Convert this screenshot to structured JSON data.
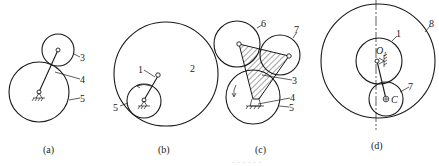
{
  "figure": {
    "panels": [
      {
        "id": "a",
        "caption": "(a)",
        "labels": {
          "l3": "3",
          "l4": "4",
          "l5": "5"
        }
      },
      {
        "id": "b",
        "caption": "(b)",
        "labels": {
          "l1": "1",
          "l2": "2",
          "l5": "5"
        }
      },
      {
        "id": "c",
        "caption": "(c)",
        "labels": {
          "l6": "6",
          "l7": "7",
          "l3": "3",
          "l4": "4",
          "l5": "5"
        }
      },
      {
        "id": "d",
        "caption": "(d)",
        "labels": {
          "l8": "8",
          "l1": "1",
          "O1": "O",
          "O1_sub": "1",
          "l7": "7",
          "C": "C"
        }
      }
    ],
    "bottom_caption_partial": "· · · · · ·"
  },
  "colors": {
    "line": "#1a1a1a",
    "background": "#ffffff"
  }
}
